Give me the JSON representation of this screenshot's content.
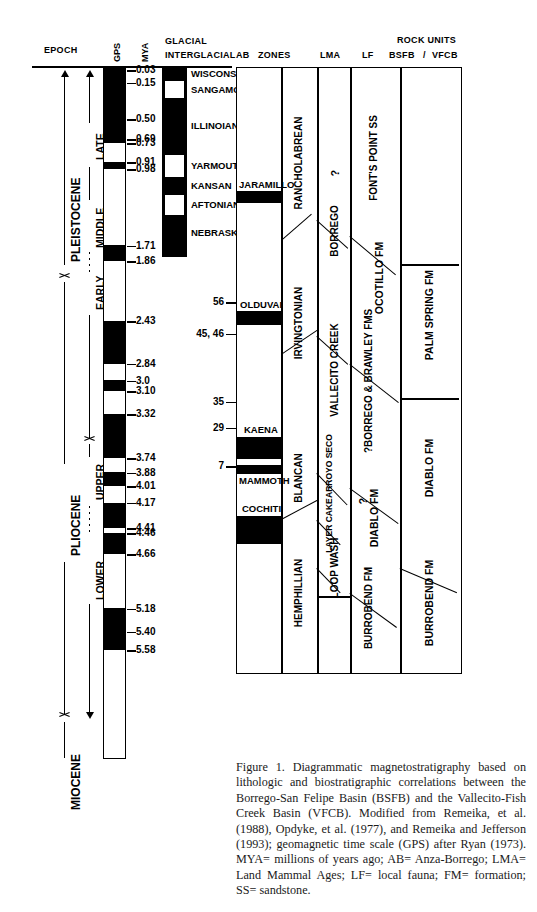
{
  "figure": {
    "caption": "Figure 1. Diagrammatic magnetostratigraphy based on lithologic and biostratigraphic correlations between the Borrego-San Felipe Basin (BSFB) and the Vallecito-Fish Creek Basin (VFCB). Modified from Remeika, et al. (1988), Opdyke, et al. (1977), and Remeika and Jefferson (1993); geomagnetic time scale (GPS) after Ryan (1973). MYA= millions of years ago; AB= Anza-Borrego; LMA= Land Mammal Ages; LF= local fauna; FM= formation; SS= sandstone."
  },
  "headers": {
    "epoch": "EPOCH",
    "gps": "GPS",
    "mya": "MYA",
    "glacial_line1": "GLACIAL",
    "glacial_line2": "INTERGLACIAL",
    "ab": "AB",
    "zones": "ZONES",
    "lma": "LMA",
    "lf": "LF",
    "rock_units": "ROCK UNITS",
    "bsfb": "BSFB",
    "slash": "/",
    "vfcb": "VFCB"
  },
  "epochs": [
    {
      "label": "PLEISTOCENE",
      "top": 0.03,
      "bottom": 1.71
    },
    {
      "label": "PLIOCENE",
      "top": 1.71,
      "bottom": 5.4
    },
    {
      "label": "MIOCENE",
      "top": 5.4,
      "bottom": 6.6
    }
  ],
  "subepochs": [
    {
      "label": "LATE",
      "top": 0.03,
      "bottom": 0.5
    },
    {
      "label": "MIDDLE",
      "top": 0.5,
      "bottom": 1.0
    },
    {
      "label": "EARLY",
      "top": 1.0,
      "bottom": 1.71
    },
    {
      "label": "UPPER",
      "top": 1.86,
      "bottom": 3.2
    },
    {
      "label": "LOWER",
      "top": 3.4,
      "bottom": 5.4
    }
  ],
  "polarity_chrons": [
    {
      "label": "BRUNNES NORMAL",
      "top": 0.03,
      "bottom": 0.73
    },
    {
      "label": "MATUYAMA REVERSED",
      "top": 0.73,
      "bottom": 2.47
    },
    {
      "label": "GAUSS NORMAL",
      "top": 2.47,
      "bottom": 3.4
    },
    {
      "label": "GILBERT REVERSED",
      "top": 3.4,
      "bottom": 5.4
    }
  ],
  "mya_ticks": [
    0.03,
    0.15,
    0.5,
    0.69,
    0.73,
    0.91,
    0.98,
    1.71,
    1.86,
    2.43,
    2.84,
    3.0,
    3.1,
    3.32,
    3.74,
    3.88,
    4.01,
    4.17,
    4.41,
    4.46,
    4.66,
    5.18,
    5.4,
    5.58
  ],
  "mya_tick_labels": [
    "0.03",
    "0.15",
    "0.50",
    "0.69",
    "0.73",
    "0.91",
    "0.98",
    "1.71",
    "1.86",
    "2.43",
    "2.84",
    "3.0",
    "3.10",
    "3.32",
    "3.74",
    "3.88",
    "4.01",
    "4.17",
    "4.41",
    "4.46",
    "4.66",
    "5.18",
    "5.40",
    "5.58"
  ],
  "gps_normal_bands": [
    {
      "from": 0.0,
      "to": 0.73
    },
    {
      "from": 0.91,
      "to": 0.98
    },
    {
      "from": 1.71,
      "to": 1.86
    },
    {
      "from": 2.43,
      "to": 2.84
    },
    {
      "from": 3.0,
      "to": 3.1
    },
    {
      "from": 3.32,
      "to": 3.74
    },
    {
      "from": 3.88,
      "to": 4.01
    },
    {
      "from": 4.17,
      "to": 4.41
    },
    {
      "from": 4.46,
      "to": 4.66
    },
    {
      "from": 5.18,
      "to": 5.58
    }
  ],
  "glacial_stages": [
    {
      "label": "WISCONSIN",
      "type": "glacial",
      "from": 0.0,
      "to": 0.12
    },
    {
      "label": "SANGAMONIAN",
      "type": "interglacial",
      "from": 0.12,
      "to": 0.26
    },
    {
      "label": "ILLINOIAN",
      "type": "glacial",
      "from": 0.26,
      "to": 0.74
    },
    {
      "label": "YARMOUTHIAN",
      "type": "interglacial",
      "from": 0.74,
      "to": 0.93
    },
    {
      "label": "KANSAN",
      "type": "glacial",
      "from": 0.93,
      "to": 1.08
    },
    {
      "label": "AFTONIAN",
      "type": "interglacial",
      "from": 1.08,
      "to": 1.25
    },
    {
      "label": "NEBRASKAN",
      "type": "glacial",
      "from": 1.25,
      "to": 1.55
    }
  ],
  "ab_zones": [
    {
      "label": "JARAMILLO",
      "from": 0.89,
      "to": 1.0
    },
    {
      "label": "OLDUVAI",
      "from": 1.71,
      "to": 1.89
    },
    {
      "label": "KAENA",
      "from": 2.95,
      "to": 3.2
    },
    {
      "label": "MAMMOTH",
      "from": 3.26,
      "to": 3.42
    },
    {
      "label": "COCHITI",
      "from": 3.65,
      "to": 3.95
    }
  ],
  "ab_zone_ticks": [
    {
      "label": "56",
      "at": 2.25
    },
    {
      "label": "45, 46",
      "at": 2.55
    },
    {
      "label": "35",
      "at": 3.2
    },
    {
      "label": "29",
      "at": 3.45
    },
    {
      "label": "7",
      "at": 3.82
    }
  ],
  "lma": [
    {
      "label": "RANCHOLABREAN",
      "from": 0.0,
      "to": 0.85
    },
    {
      "label": "IRVINGTONIAN",
      "from": 0.85,
      "to": 2.2
    },
    {
      "label": "BLANCAN",
      "from": 2.2,
      "to": 3.95
    },
    {
      "label": "HEMPHILLIAN",
      "from": 3.95,
      "to": 6.0
    }
  ],
  "lf": [
    {
      "label": "?",
      "note": "Rancholabrean local fauna uncertain"
    },
    {
      "label": "BORREGO"
    },
    {
      "label": "VALLECITO CREEK"
    },
    {
      "label": "ARROYO SECO"
    },
    {
      "label": "LAYER CAKE"
    },
    {
      "label": "LOOP WASH"
    }
  ],
  "rock_units_bsfb": [
    {
      "label": "FONT'S POINT SS"
    },
    {
      "label": "OCOTILLO FM"
    },
    {
      "label": "BORREGO & BRAWLEY FMS",
      "query": "?"
    },
    {
      "label": "DIABLO FM",
      "query": "?"
    },
    {
      "label": "BURROBEND FM"
    }
  ],
  "rock_units_vfcb": [
    {
      "label": ""
    },
    {
      "label": "PALM SPRING FM"
    },
    {
      "label": "DIABLO FM"
    },
    {
      "label": "BURROBEND FM"
    }
  ]
}
